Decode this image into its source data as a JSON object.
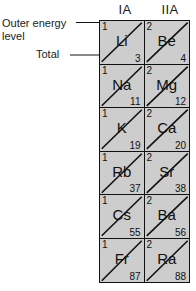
{
  "figure": {
    "cell_background": "#cdcdcd",
    "line_color": "#111111"
  },
  "headers": [
    {
      "label": "IA"
    },
    {
      "label": "IIA"
    }
  ],
  "annotations": {
    "outer_energy_level": "Outer energy level",
    "total": "Total"
  },
  "legend_target": {
    "outer_energy_level_value": "1",
    "total_value": "3"
  },
  "elements": [
    {
      "symbol": "Li",
      "outer_shell": "1",
      "atomic_number": "3",
      "group": "IA",
      "period": 2
    },
    {
      "symbol": "Be",
      "outer_shell": "2",
      "atomic_number": "4",
      "group": "IIA",
      "period": 2
    },
    {
      "symbol": "Na",
      "outer_shell": "1",
      "atomic_number": "11",
      "group": "IA",
      "period": 3
    },
    {
      "symbol": "Mg",
      "outer_shell": "2",
      "atomic_number": "12",
      "group": "IIA",
      "period": 3
    },
    {
      "symbol": "K",
      "outer_shell": "1",
      "atomic_number": "19",
      "group": "IA",
      "period": 4
    },
    {
      "symbol": "Ca",
      "outer_shell": "2",
      "atomic_number": "20",
      "group": "IIA",
      "period": 4
    },
    {
      "symbol": "Rb",
      "outer_shell": "1",
      "atomic_number": "37",
      "group": "IA",
      "period": 5
    },
    {
      "symbol": "Sr",
      "outer_shell": "2",
      "atomic_number": "38",
      "group": "IIA",
      "period": 5
    },
    {
      "symbol": "Cs",
      "outer_shell": "1",
      "atomic_number": "55",
      "group": "IA",
      "period": 6
    },
    {
      "symbol": "Ba",
      "outer_shell": "2",
      "atomic_number": "56",
      "group": "IIA",
      "period": 6
    },
    {
      "symbol": "Fr",
      "outer_shell": "1",
      "atomic_number": "87",
      "group": "IA",
      "period": 7
    },
    {
      "symbol": "Ra",
      "outer_shell": "2",
      "atomic_number": "88",
      "group": "IIA",
      "period": 7
    }
  ]
}
